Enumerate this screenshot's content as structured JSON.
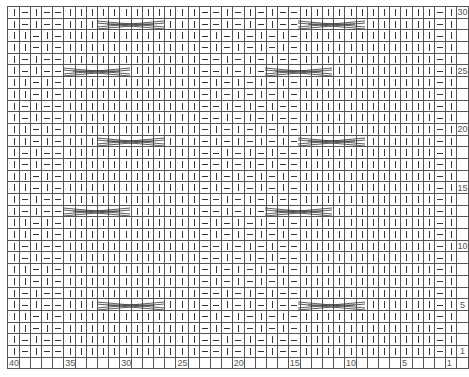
{
  "chart_title": "",
  "legend": {
    "knit": "|",
    "purl": "−",
    "cable": "6-st cable cross"
  },
  "columns": 40,
  "rows_count": 30,
  "column_labels": [
    {
      "col": 40,
      "text": "40"
    },
    {
      "col": 35,
      "text": "35"
    },
    {
      "col": 30,
      "text": "30"
    },
    {
      "col": 25,
      "text": "25"
    },
    {
      "col": 20,
      "text": "20"
    },
    {
      "col": 15,
      "text": "15"
    },
    {
      "col": 10,
      "text": "10"
    },
    {
      "col": 5,
      "text": "5"
    },
    {
      "col": 1,
      "text": "1"
    }
  ],
  "row_labels": [
    {
      "row": 30,
      "text": "30"
    },
    {
      "row": 25,
      "text": "25"
    },
    {
      "row": 20,
      "text": "20"
    },
    {
      "row": 15,
      "text": "15"
    },
    {
      "row": 10,
      "text": "10"
    },
    {
      "row": 5,
      "text": "5"
    },
    {
      "row": 1,
      "text": "1"
    }
  ],
  "rows": [
    "KPKPPKKKKKKKKKKKKPPKPKPKPPKKKKKKKKKKKKPK",
    "KPKPPKKKKKKKKKKKKPPKPKPKPPKKKKKKKKKKKKPK",
    "KKPKPKKKKKKKKKKKKPKPKPKPKPKKKKKKKKKKKKPK",
    "KKPKPKKKKKKKKKKKKPKPKPKPKPKKKKKKKKKKKKPK",
    "KPKPPKKKKKKKKKKKKPPKPKPKPPKKKKKKKKKKKKPK",
    "KPKPPKKKKKKKKKKKKPPKPKPKPPKKKKKKKKKKKKPK",
    "KKPKPKKKKKKKKKKKKPKPKPKPKPKKKKKKKKKKKKPK",
    "KKPKPKKKKKKKKKKKKPKPKPKPKPKKKKKKKKKKKKPK",
    "KPKPPKKKKKKKKKKKKPPKPKPKPPKKKKKKKKKKKKPK",
    "KPKPPKKKKKKKKKKKKPPKPKPKPPKKKKKKKKKKKKPK",
    "KKPKPKKKKKKKKKKKKPKPKPKPKPKKKKKKKKKKKKPK",
    "KKPKPKKKKKKKKKKKKPKPKPKPKPKKKKKKKKKKKKPK",
    "KPKPPKKKKKKKKKKKKPPKPKPKPPKKKKKKKKKKKKPK",
    "KPKPPKKKKKKKKKKKKPPKPKPKPPKKKKKKKKKKKKPK",
    "KKPKPKKKKKKKKKKKKPKPKPKPKPKKKKKKKKKKKKPK",
    "KKPKPKKKKKKKKKKKKPKPKPKPKPKKKKKKKKKKKKPK",
    "KPKPPKKKKKKKKKKKKPPKPKPKPPKKKKKKKKKKKKPK",
    "KPKPPKKKKKKKKKKKKPPKPKPKPPKKKKKKKKKKKKPK",
    "KKPKPKKKKKKKKKKKKPKPKPKPKPKKKKKKKKKKKKPK",
    "KKPKPKKKKKKKKKKKKPKPKPKPKPKKKKKKKKKKKKPK",
    "KPKPPKKKKKKKKKKKKPPKPKPKPPKKKKKKKKKKKKPK",
    "KPKPPKKKKKKKKKKKKPPKPKPKPPKKKKKKKKKKKKPK",
    "KKPKPKKKKKKKKKKKKPKPKPKPKPKKKKKKKKKKKKPK",
    "KKPKPKKKKKKKKKKKKPKPKPKPKPKKKKKKKKKKKKPK",
    "KPKPPKKKKKKKKKKKKPPKPKPKPPKKKKKKKKKKKKPK",
    "KPKPPKKKKKKKKKKKKPPKPKPKPPKKKKKKKKKKKKPK",
    "KKPKPKKKKKKKKKKKKPKPKPKPKPKKKKKKKKKKKKPK",
    "KKPKPKKKKKKKKKKKKPKPKPKPKPKKKKKKKKKKKKPK",
    "KPKPPKKKKKKKKKKKKPPKPKPKPPKKKKKKKKKKKKPK",
    "KPKPPKKKKKKKKKKKKPPKPKPKPPKKKKKKKKKKKKPK"
  ],
  "cables": [
    {
      "row": 29,
      "start_col": 32,
      "width": 6
    },
    {
      "row": 29,
      "start_col": 14,
      "width": 6
    },
    {
      "row": 25,
      "start_col": 35,
      "width": 6
    },
    {
      "row": 25,
      "start_col": 17,
      "width": 6
    },
    {
      "row": 19,
      "start_col": 32,
      "width": 6
    },
    {
      "row": 19,
      "start_col": 14,
      "width": 6
    },
    {
      "row": 13,
      "start_col": 35,
      "width": 6
    },
    {
      "row": 13,
      "start_col": 17,
      "width": 6
    },
    {
      "row": 5,
      "start_col": 32,
      "width": 6
    },
    {
      "row": 5,
      "start_col": 14,
      "width": 6
    }
  ]
}
